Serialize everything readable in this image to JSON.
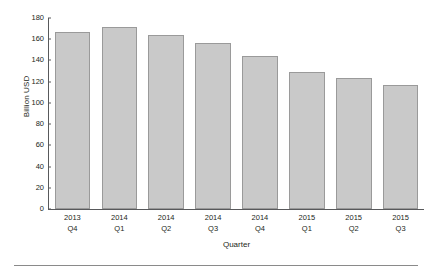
{
  "chart_data": {
    "type": "bar",
    "title": "",
    "subtitle": "",
    "xlabel": "Quarter",
    "ylabel": "Billion USD",
    "categories": [
      "2013 Q4",
      "2014 Q1",
      "2014 Q2",
      "2014 Q3",
      "2014 Q4",
      "2015 Q1",
      "2015 Q2",
      "2015 Q3"
    ],
    "category_lines": [
      [
        "2013",
        "Q4"
      ],
      [
        "2014",
        "Q1"
      ],
      [
        "2014",
        "Q2"
      ],
      [
        "2014",
        "Q3"
      ],
      [
        "2014",
        "Q4"
      ],
      [
        "2015",
        "Q1"
      ],
      [
        "2015",
        "Q2"
      ],
      [
        "2015",
        "Q3"
      ]
    ],
    "values": [
      167,
      172,
      164,
      156,
      144,
      129,
      123,
      117
    ],
    "ylim": [
      0,
      180
    ],
    "yticks": [
      0,
      20,
      40,
      60,
      80,
      100,
      120,
      140,
      160,
      180
    ],
    "ytick_labels": [
      "0",
      "20",
      "40",
      "60",
      "80",
      "100",
      "120",
      "140",
      "160",
      "180"
    ],
    "grid": false,
    "legend": null,
    "legend_position": "none",
    "bar_fill_color": "#c9c9c9",
    "bar_border_color": "#9a9a9a",
    "axis_color": "#58595b",
    "text_color": "#231f20",
    "background_color": "#ffffff"
  }
}
